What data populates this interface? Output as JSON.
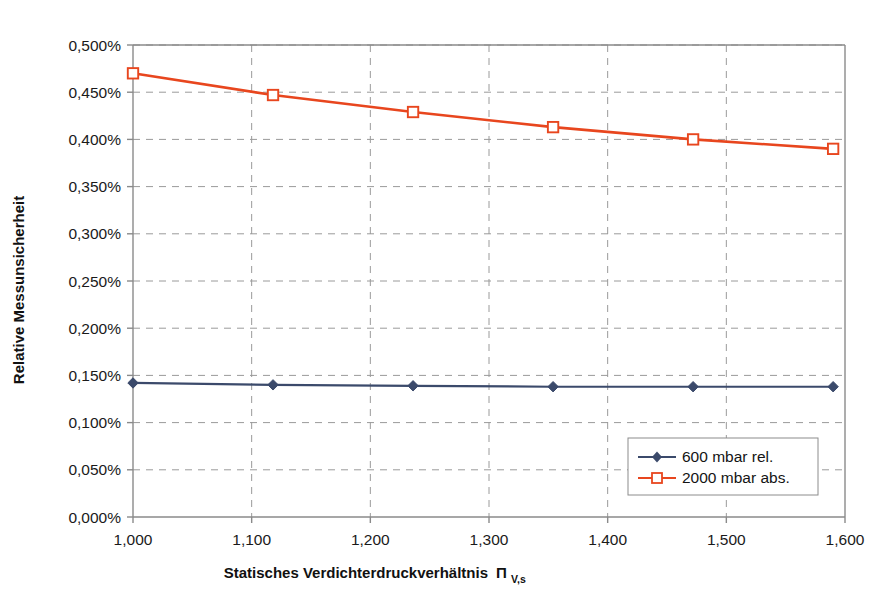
{
  "chart_data": {
    "type": "line",
    "title": "",
    "xlabel": "Statisches Verdichterdruckverhältnis ΠV,s",
    "xlabel_main": "Statisches Verdichterdruckverhältnis",
    "xlabel_symbol": "Π",
    "xlabel_subscript": "V,s",
    "ylabel": "Relative Messunsicherheit",
    "xlim": [
      1.0,
      1.6
    ],
    "ylim": [
      0.0,
      0.5
    ],
    "xtick_labels": [
      "1,000",
      "1,100",
      "1,200",
      "1,300",
      "1,400",
      "1,500",
      "1,600"
    ],
    "xticks": [
      1.0,
      1.1,
      1.2,
      1.3,
      1.4,
      1.5,
      1.6
    ],
    "ytick_labels": [
      "0,000%",
      "0,050%",
      "0,100%",
      "0,150%",
      "0,200%",
      "0,250%",
      "0,300%",
      "0,350%",
      "0,400%",
      "0,450%",
      "0,500%"
    ],
    "yticks": [
      0.0,
      0.05,
      0.1,
      0.15,
      0.2,
      0.25,
      0.3,
      0.35,
      0.4,
      0.45,
      0.5
    ],
    "grid": "dashed both axes",
    "legend_position": "lower right inside",
    "x": [
      1.0,
      1.118,
      1.236,
      1.354,
      1.472,
      1.59
    ],
    "series": [
      {
        "name": "600 mbar rel.",
        "color": "#3b4a6b",
        "marker": "filled-diamond",
        "values": [
          0.142,
          0.14,
          0.139,
          0.138,
          0.138,
          0.138
        ]
      },
      {
        "name": "2000 mbar abs.",
        "color": "#e8461e",
        "marker": "open-square",
        "values": [
          0.47,
          0.447,
          0.429,
          0.413,
          0.4,
          0.39
        ]
      }
    ]
  },
  "legend": {
    "entries": [
      {
        "label": "600 mbar rel."
      },
      {
        "label": "2000 mbar abs."
      }
    ]
  },
  "colors": {
    "series_1": "#3b4a6b",
    "series_2": "#e8461e",
    "axis": "#8a8a8a",
    "grid": "#9a9a9a",
    "text": "#1a1a1a",
    "background": "#ffffff"
  }
}
